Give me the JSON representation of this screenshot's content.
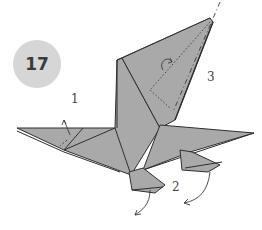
{
  "step": {
    "number": "17"
  },
  "callouts": [
    {
      "id": "1",
      "label": "1",
      "x": 71,
      "y": 92
    },
    {
      "id": "2",
      "label": "2",
      "x": 172,
      "y": 180
    },
    {
      "id": "3",
      "label": "3",
      "x": 207,
      "y": 70
    }
  ],
  "figure": {
    "paper_color": "#a9a9a9",
    "line_color": "#2f2f2f"
  }
}
